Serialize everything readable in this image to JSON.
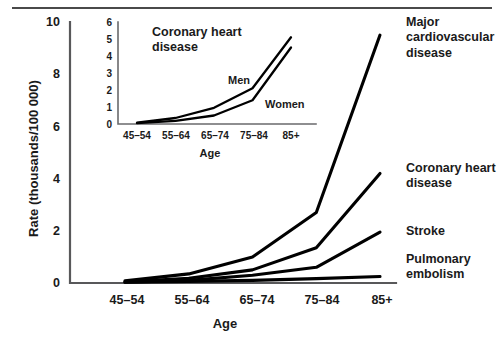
{
  "figure": {
    "background": "#ffffff",
    "line_color": "#000000",
    "axis_color": "#58585a"
  },
  "chart_data": {
    "type": "line",
    "title": "",
    "xlabel": "Age",
    "ylabel": "Rate (thousands/100 000)",
    "categories": [
      "45–54",
      "55–64",
      "65–74",
      "75–84",
      "85+"
    ],
    "xtick_labels": [
      "45–54",
      "55–64",
      "65–74",
      "75–84",
      "85+"
    ],
    "ytick_labels": [
      "0",
      "2",
      "4",
      "6",
      "8",
      "10"
    ],
    "ytick_values": [
      0,
      2,
      4,
      6,
      8,
      10
    ],
    "ylim": [
      0,
      10
    ],
    "grid": false,
    "legend_position": "right-inline-annotations",
    "series": [
      {
        "name": "Major cardiovascular disease",
        "label": "Major\ncardiovascular\ndisease",
        "values": [
          0.08,
          0.35,
          1.0,
          2.7,
          9.5
        ]
      },
      {
        "name": "Coronary heart disease",
        "label": "Coronary heart\ndisease",
        "values": [
          0.05,
          0.18,
          0.5,
          1.35,
          4.2
        ]
      },
      {
        "name": "Stroke",
        "label": "Stroke",
        "values": [
          0.03,
          0.1,
          0.3,
          0.6,
          1.95
        ]
      },
      {
        "name": "Pulmonary embolism",
        "label": "Pulmonary\nembolism",
        "values": [
          0.03,
          0.06,
          0.1,
          0.17,
          0.25
        ]
      }
    ],
    "inset": {
      "type": "line",
      "title": "Coronary heart\ndisease",
      "xlabel": "Age",
      "ylabel": "",
      "categories": [
        "45–54",
        "55–64",
        "65–74",
        "75–84",
        "85+"
      ],
      "xtick_labels": [
        "45–54",
        "55–64",
        "65–74",
        "75–84",
        "85+"
      ],
      "ytick_labels": [
        "0",
        "1",
        "2",
        "3",
        "4",
        "5",
        "6"
      ],
      "ytick_values": [
        0,
        1,
        2,
        3,
        4,
        5,
        6
      ],
      "ylim": [
        0,
        6
      ],
      "grid": false,
      "legend_position": "inline-annotations",
      "series": [
        {
          "name": "Men",
          "label": "Men",
          "values": [
            0.08,
            0.35,
            0.95,
            2.1,
            5.1
          ]
        },
        {
          "name": "Women",
          "label": "Women",
          "values": [
            0.05,
            0.18,
            0.5,
            1.4,
            4.5
          ]
        }
      ]
    }
  }
}
